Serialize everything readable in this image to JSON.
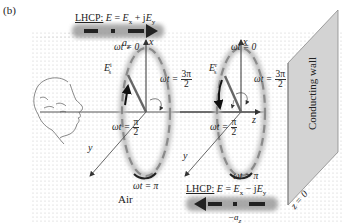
{
  "figure": {
    "panel_label": "(b)",
    "region_label": "Air",
    "wall": {
      "label": "Conducting wall",
      "position_label": "z = 0",
      "fill_color": "#d3d3d3"
    },
    "incident_wave": {
      "title": "LHCP:",
      "equation_lhs": "E",
      "equation_rhs_1": "E",
      "sub_1": "x",
      "operator": "+ j",
      "equation_rhs_2": "E",
      "sub_2": "y",
      "direction_label": "a",
      "direction_sub": "z"
    },
    "reflected_wave": {
      "title": "LHCP:",
      "equation_lhs": "E",
      "equation_rhs_1": "E",
      "sub_1": "x",
      "operator": "− j",
      "equation_rhs_2": "E",
      "sub_2": "y",
      "direction_label": "−a",
      "direction_sub": "z"
    },
    "ellipse_1": {
      "field_label": "E",
      "field_sub": "s",
      "field_sup": "i",
      "top_label": "ωt = 0",
      "right_label_prefix": "ωt =",
      "right_num": "3π",
      "right_den": "2",
      "left_label_prefix": "ωt =",
      "left_num": "π",
      "left_den": "2",
      "bottom_label": "ωt = π"
    },
    "ellipse_2": {
      "field_label": "E",
      "field_sub": "s",
      "field_sup": "r",
      "top_label": "ωt = 0",
      "right_label_prefix": "ωt =",
      "right_num": "3π",
      "right_den": "2",
      "left_label_prefix": "ωt =",
      "left_num": "π",
      "left_den": "2",
      "bottom_label": "ωt = π"
    },
    "axes": {
      "x_label": "x",
      "y_label": "y",
      "z_label": "z"
    },
    "colors": {
      "background_dots": "#c8c8c8",
      "ellipse_glow": "#b8b8b8",
      "ellipse_dash": "#888888",
      "arrow_dark": "#222222",
      "wave_band": "#9a9a9a"
    }
  }
}
